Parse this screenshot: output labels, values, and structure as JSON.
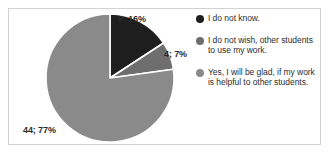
{
  "chart_data": {
    "type": "pie",
    "title": "",
    "subtitle": "",
    "xlabel": "",
    "ylabel": "",
    "grid": false,
    "legend_position": "right",
    "start_angle_deg": 0,
    "direction": "clockwise",
    "categories": [
      "I do not know.",
      "I do not wish, other students to use my work.",
      "Yes, I will be glad, if my work is helpful to other students."
    ],
    "values": [
      9,
      4,
      44
    ],
    "percentages": [
      16,
      7,
      77
    ],
    "total": 57,
    "colors": [
      "#1e1e1e",
      "#6e6e6e",
      "#8a8a8a"
    ],
    "slice_separator_color": "#ffffff",
    "data_labels": [
      "9; 16%",
      "4; 7%",
      "44; 77%"
    ],
    "slices": [
      {
        "label": "9; 16%",
        "value": 9,
        "percent": 16,
        "color": "#1e1e1e"
      },
      {
        "label": "4; 7%",
        "value": 4,
        "percent": 7,
        "color": "#6e6e6e"
      },
      {
        "label": "44; 77%",
        "value": 44,
        "percent": 77,
        "color": "#8a8a8a"
      }
    ]
  },
  "legend": {
    "items": [
      {
        "label": "I do not know.",
        "color": "#1e1e1e"
      },
      {
        "label": "I do not wish, other students to use my work.",
        "color": "#6e6e6e"
      },
      {
        "label": "Yes, I will be glad, if my work is helpful to other students.",
        "color": "#8a8a8a"
      }
    ]
  },
  "frame": {
    "border_color": "#d2d2d2",
    "background_color": "#ffffff"
  }
}
